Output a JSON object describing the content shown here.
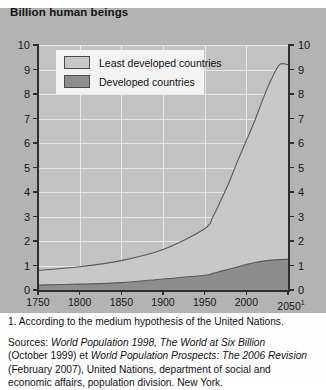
{
  "chart_data": {
    "type": "area",
    "stacked": true,
    "title": "Billion human beings",
    "xlabel": "",
    "ylabel": "",
    "xlim": [
      1750,
      2050
    ],
    "ylim": [
      0,
      10
    ],
    "grid": true,
    "legend_position": "top-left",
    "x_ticks": [
      "1750",
      "1800",
      "1850",
      "1900",
      "1950",
      "2000",
      "2050"
    ],
    "x_tick_values": [
      1750,
      1800,
      1850,
      1900,
      1950,
      2000,
      2050
    ],
    "y_ticks": [
      "0",
      "1",
      "2",
      "3",
      "4",
      "5",
      "6",
      "7",
      "8",
      "9",
      "10"
    ],
    "y_tick_values": [
      0,
      1,
      2,
      3,
      4,
      5,
      6,
      7,
      8,
      9,
      10
    ],
    "x": [
      1750,
      1800,
      1850,
      1900,
      1950,
      1960,
      1970,
      1980,
      1990,
      2000,
      2010,
      2020,
      2030,
      2040,
      2050
    ],
    "series": [
      {
        "name": "Developed countries",
        "color": "#8d8d8d",
        "values": [
          0.2,
          0.24,
          0.3,
          0.45,
          0.6,
          0.68,
          0.77,
          0.86,
          0.95,
          1.04,
          1.12,
          1.18,
          1.22,
          1.24,
          1.25
        ]
      },
      {
        "name": "Least developed countries",
        "color": "#c8c8c8",
        "values": [
          0.6,
          0.71,
          0.9,
          1.2,
          1.9,
          2.32,
          2.93,
          3.59,
          4.35,
          5.06,
          5.78,
          6.62,
          7.38,
          7.96,
          7.95
        ]
      }
    ],
    "totals": [
      0.8,
      0.95,
      1.2,
      1.65,
      2.5,
      3.0,
      3.7,
      4.45,
      5.3,
      6.1,
      6.9,
      7.8,
      8.6,
      9.2,
      9.2
    ],
    "footnote_marker": "1"
  },
  "chart": {
    "title": "Billion human beings",
    "legend": [
      {
        "label": "Least developed countries",
        "swatch": "light-gray"
      },
      {
        "label": "Developed countries",
        "swatch": "dark-gray"
      }
    ]
  },
  "footnote": {
    "text": "1. According to the medium hypothesis of the United Nations."
  },
  "sources": {
    "line1_prefix": "Sources: ",
    "line1_italic": "World Population 1998, The World at Six Billion",
    "line2_paren": "(October 1999) et ",
    "line2_italic": "World Population Prospects: The 2006 Revision",
    "line3": "(February 2007), United Nations, department of social and",
    "line4": "economic affairs, population division. New York."
  },
  "colors": {
    "developed": "#8d8d8d",
    "least_developed": "#c8c8c8",
    "plot_background": "#c2c2c2",
    "figure_background": "#b4b4b4",
    "gridline": "#efefef",
    "axis": "#2e2e2e"
  }
}
